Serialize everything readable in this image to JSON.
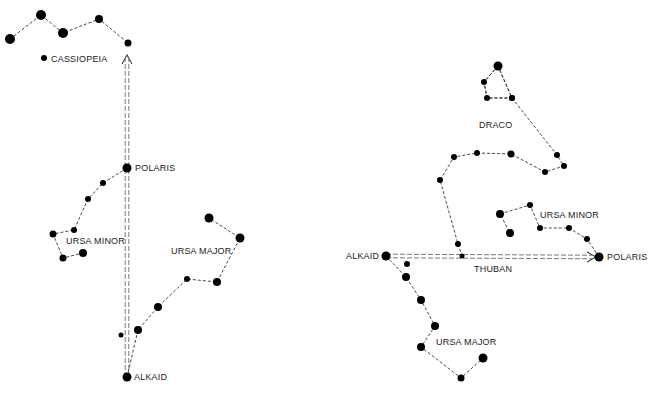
{
  "colors": {
    "star": "#000000",
    "line": "#333333",
    "arrow": "#777777",
    "text": "#222222",
    "background": "#ffffff"
  },
  "left_panel": {
    "labels": {
      "cassiopeia": "CASSIOPEIA",
      "polaris": "POLARIS",
      "ursa_minor": "URSA MINOR",
      "ursa_major": "URSA MAJOR",
      "alkaid": "ALKAID"
    },
    "cassiopeia_stars": [
      [
        10,
        39,
        5
      ],
      [
        41,
        15,
        5
      ],
      [
        63,
        33,
        5
      ],
      [
        99,
        19,
        4
      ],
      [
        128,
        43,
        3.5
      ]
    ],
    "cassiopeia_marker": [
      44,
      58,
      3
    ],
    "ursa_minor_stars": [
      [
        127,
        168,
        4.5
      ],
      [
        103,
        183,
        3
      ],
      [
        88,
        199,
        3
      ],
      [
        74,
        230,
        3
      ],
      [
        53,
        234,
        3.5
      ],
      [
        63,
        258,
        3.5
      ],
      [
        83,
        253,
        4
      ]
    ],
    "ursa_major_stars": [
      [
        127,
        377,
        4.5
      ],
      [
        138,
        330,
        4
      ],
      [
        158,
        307,
        4
      ],
      [
        187,
        279,
        3
      ],
      [
        217,
        282,
        4
      ],
      [
        240,
        238,
        4.5
      ],
      [
        209,
        218,
        4.5
      ]
    ],
    "extra_star": [
      121,
      335,
      2.5
    ],
    "arrow": {
      "from": [
        127,
        377
      ],
      "to": [
        127,
        55
      ]
    }
  },
  "right_panel": {
    "labels": {
      "draco": "DRACO",
      "ursa_minor": "URSA MINOR",
      "alkaid": "ALKAID",
      "thuban": "THUBAN",
      "polaris": "POLARIS",
      "ursa_major": "URSA MAJOR"
    },
    "draco_head": [
      [
        498,
        66,
        4.5
      ],
      [
        484,
        82,
        3
      ],
      [
        487,
        98,
        3
      ],
      [
        512,
        98,
        3
      ]
    ],
    "draco_body": [
      [
        512,
        98,
        3
      ],
      [
        557,
        155,
        3
      ],
      [
        564,
        166,
        3
      ],
      [
        545,
        172,
        3
      ],
      [
        511,
        154,
        3.5
      ],
      [
        477,
        153,
        3
      ],
      [
        454,
        157,
        3
      ],
      [
        440,
        180,
        3
      ],
      [
        458,
        244,
        3
      ],
      [
        462,
        256,
        2.5
      ]
    ],
    "ursa_minor_stars": [
      [
        599,
        257,
        4.5
      ],
      [
        587,
        239,
        3
      ],
      [
        569,
        228,
        3
      ],
      [
        540,
        228,
        3
      ],
      [
        530,
        205,
        3
      ],
      [
        500,
        214,
        4
      ],
      [
        510,
        233,
        4
      ]
    ],
    "ursa_major_stars": [
      [
        386,
        256,
        4.5
      ],
      [
        406,
        277,
        4
      ],
      [
        421,
        300,
        4
      ],
      [
        435,
        326,
        4
      ],
      [
        421,
        347,
        4
      ],
      [
        461,
        378,
        3.5
      ],
      [
        483,
        358,
        4.5
      ]
    ],
    "extra_star": [
      407,
      264,
      3
    ],
    "arrow": {
      "from": [
        386,
        256
      ],
      "to": [
        596,
        257
      ]
    }
  }
}
